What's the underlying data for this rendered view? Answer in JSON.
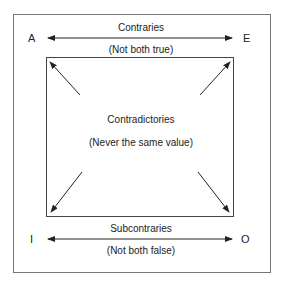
{
  "diagram": {
    "corners": {
      "top_left": "A",
      "top_right": "E",
      "bottom_left": "I",
      "bottom_right": "O"
    },
    "top_relation": {
      "name": "Contraries",
      "rule": "(Not both true)"
    },
    "diagonal_relation": {
      "name": "Contradictories",
      "rule": "(Never the same value)"
    },
    "bottom_relation": {
      "name": "Subcontraries",
      "rule": "(Not both false)"
    },
    "colors": {
      "line": "#333333",
      "frame": "#777777",
      "background": "#ffffff"
    }
  }
}
